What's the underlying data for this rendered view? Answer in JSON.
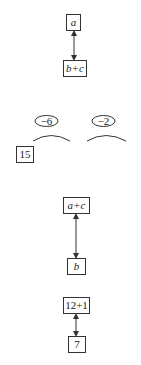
{
  "diagrams": [
    {
      "type": "double-arrow-pair",
      "top": {
        "label": "a",
        "italic": true
      },
      "bottom": {
        "label": "b+c",
        "italic": true
      }
    },
    {
      "type": "oval-arcs",
      "ovals": [
        {
          "label": "−6"
        },
        {
          "label": "−2"
        }
      ],
      "box": {
        "label": "15"
      }
    },
    {
      "type": "double-arrow-pair",
      "top": {
        "label": "a+c",
        "italic": true
      },
      "bottom": {
        "label": "b",
        "italic": true
      }
    },
    {
      "type": "double-arrow-pair",
      "top": {
        "label": "12+1",
        "italic": false
      },
      "bottom": {
        "label": "7",
        "italic": false
      }
    }
  ],
  "colors": {
    "stroke": "#333333",
    "background": "#ffffff"
  }
}
